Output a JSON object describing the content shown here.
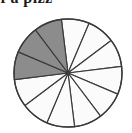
{
  "caption": {
    "text_fragment": "ces of a pizz",
    "full_line_as_rendered": "ces of a pizz",
    "cropped": true
  },
  "figure": {
    "name": "pizza-fraction-pie",
    "center_x": 68,
    "center_y": 73,
    "radius": 54,
    "cropped_at_bottom": true
  },
  "colors": {
    "shaded_fill": "#8c8c8c",
    "unshaded_fill": "#fbfbfb",
    "outline": "#3a3a3a",
    "text": "#1c1c1c",
    "background": "#ffffff"
  },
  "chart_data": {
    "type": "pie",
    "title": "",
    "subtitle": "",
    "xlabel": "",
    "ylabel": "",
    "total_slices": 12,
    "slice_angle_degrees": 30,
    "shaded_count": 3,
    "unshaded_count": 9,
    "fraction_shaded": "3/12",
    "legend_position": "none",
    "grid": false,
    "categories": [
      "slice-1",
      "slice-2",
      "slice-3",
      "slice-4",
      "slice-5",
      "slice-6",
      "slice-7",
      "slice-8",
      "slice-9",
      "slice-10",
      "slice-11",
      "slice-12"
    ],
    "values": [
      8.3333,
      8.3333,
      8.3333,
      8.3333,
      8.3333,
      8.3333,
      8.3333,
      8.3333,
      8.3333,
      8.3333,
      8.3333,
      8.3333
    ],
    "slices": [
      {
        "index": 1,
        "start_deg": -97,
        "end_deg": -67,
        "shaded": false
      },
      {
        "index": 2,
        "start_deg": -67,
        "end_deg": -37,
        "shaded": false
      },
      {
        "index": 3,
        "start_deg": -37,
        "end_deg": -7,
        "shaded": false
      },
      {
        "index": 4,
        "start_deg": -7,
        "end_deg": 23,
        "shaded": false
      },
      {
        "index": 5,
        "start_deg": 23,
        "end_deg": 53,
        "shaded": false
      },
      {
        "index": 6,
        "start_deg": 53,
        "end_deg": 83,
        "shaded": false
      },
      {
        "index": 7,
        "start_deg": 83,
        "end_deg": 113,
        "shaded": false
      },
      {
        "index": 8,
        "start_deg": 113,
        "end_deg": 143,
        "shaded": false
      },
      {
        "index": 9,
        "start_deg": 143,
        "end_deg": 173,
        "shaded": false
      },
      {
        "index": 10,
        "start_deg": 173,
        "end_deg": 203,
        "shaded": true
      },
      {
        "index": 11,
        "start_deg": 203,
        "end_deg": 233,
        "shaded": true
      },
      {
        "index": 12,
        "start_deg": 233,
        "end_deg": 263,
        "shaded": true
      }
    ]
  }
}
